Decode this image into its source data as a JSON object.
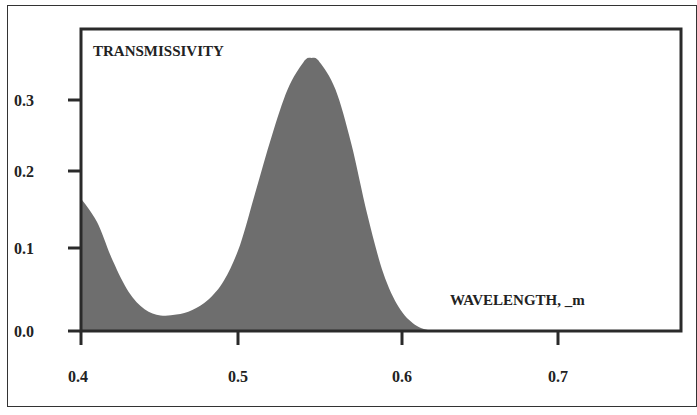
{
  "chart_data": {
    "type": "area",
    "title": "",
    "ylabel": "TRANSMISSIVITY",
    "xlabel": "WAVELENGTH, _m",
    "xlim": [
      0.4,
      0.78
    ],
    "ylim": [
      0.0,
      0.36
    ],
    "xticks": [
      "0.4",
      "0.5",
      "0.6",
      "0.7"
    ],
    "yticks": [
      "0.0",
      "0.1",
      "0.2",
      "0.3"
    ],
    "grid": false,
    "legend": null,
    "series": [
      {
        "name": "Transmissivity",
        "color": "#6e6e6e",
        "x": [
          0.4,
          0.41,
          0.42,
          0.43,
          0.44,
          0.45,
          0.46,
          0.47,
          0.48,
          0.49,
          0.5,
          0.51,
          0.52,
          0.53,
          0.54,
          0.545,
          0.55,
          0.56,
          0.57,
          0.58,
          0.59,
          0.6,
          0.61,
          0.62
        ],
        "values": [
          0.17,
          0.14,
          0.09,
          0.05,
          0.028,
          0.02,
          0.021,
          0.027,
          0.04,
          0.065,
          0.11,
          0.18,
          0.25,
          0.31,
          0.345,
          0.35,
          0.345,
          0.31,
          0.24,
          0.15,
          0.075,
          0.03,
          0.008,
          0.0
        ]
      }
    ]
  }
}
